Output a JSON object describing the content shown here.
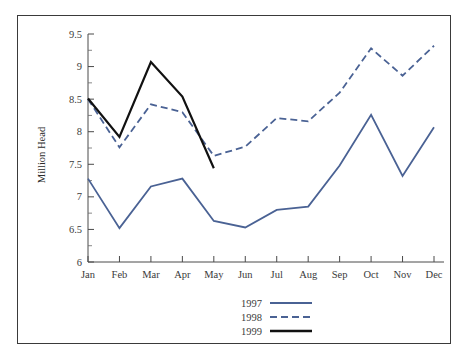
{
  "figure": {
    "border_color": "#3a3a3a",
    "background": "#ffffff"
  },
  "chart_data": {
    "type": "line",
    "title": "",
    "xlabel": "",
    "ylabel": "Million Head",
    "categories": [
      "Jan",
      "Feb",
      "Mar",
      "Apr",
      "May",
      "Jun",
      "Jul",
      "Aug",
      "Sep",
      "Oct",
      "Nov",
      "Dec"
    ],
    "ylim": [
      6,
      9.5
    ],
    "ytick_labels": [
      "6",
      "6.5",
      "7",
      "7.5",
      "8",
      "8.5",
      "9",
      "9.5"
    ],
    "ytick_values": [
      6,
      6.5,
      7,
      7.5,
      8,
      8.5,
      9,
      9.5
    ],
    "minor_ticks": true,
    "grid": false,
    "legend_position": "bottom-center",
    "series": [
      {
        "name": "1997",
        "color": "#4a6294",
        "style": "solid",
        "width": 1.8,
        "values": [
          7.28,
          6.52,
          7.16,
          7.28,
          6.63,
          6.53,
          6.8,
          6.85,
          7.48,
          8.26,
          7.32,
          8.07
        ]
      },
      {
        "name": "1998",
        "color": "#4a6294",
        "style": "dashed",
        "width": 1.8,
        "values": [
          8.5,
          7.76,
          8.42,
          8.3,
          7.63,
          7.77,
          8.21,
          8.16,
          8.6,
          9.28,
          8.86,
          9.32
        ]
      },
      {
        "name": "1999",
        "color": "#111111",
        "style": "solid",
        "width": 2.2,
        "values": [
          8.51,
          7.92,
          9.07,
          8.54,
          7.44,
          null,
          null,
          null,
          null,
          null,
          null,
          null
        ]
      }
    ]
  },
  "legend": {
    "entries": [
      {
        "label": "1997",
        "color": "#4a6294",
        "style": "solid"
      },
      {
        "label": "1998",
        "color": "#4a6294",
        "style": "dashed"
      },
      {
        "label": "1999",
        "color": "#111111",
        "style": "solid"
      }
    ]
  }
}
